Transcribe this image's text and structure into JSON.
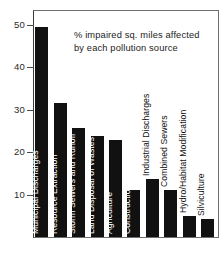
{
  "chart_data": {
    "type": "bar",
    "title": "% impaired sq. miles affected by each pollution source",
    "title_line1": "% impaired sq. miles affected",
    "title_line2": "by each pollution source",
    "xlabel": "",
    "ylabel": "",
    "ylim": [
      0,
      56
    ],
    "grid": false,
    "legend": false,
    "orientation": "vertical",
    "bar_color": "#111111",
    "yticks": [
      10,
      20,
      30,
      40,
      50
    ],
    "ytick_labels": [
      "10",
      "20",
      "30",
      "40",
      "50"
    ],
    "categories": [
      "Municipal Discharges",
      "Resource Extraction",
      "Storm Sewers and Runoff",
      "Land Disposal of Wastes",
      "Agriculture",
      "Construction",
      "Industrial Discharges",
      "Combined Sewers",
      "Hydro/Habitat Modification",
      "Silviculture"
    ],
    "values": [
      54,
      34.5,
      28,
      26,
      25,
      12,
      15,
      12,
      5.5,
      4.5
    ],
    "bars": [
      {
        "label": "Municipal Discharges",
        "value": 54,
        "label_inside": true
      },
      {
        "label": "Resource Extraction",
        "value": 34.5,
        "label_inside": true
      },
      {
        "label": "Storm Sewers and Runoff",
        "value": 28,
        "label_inside": true
      },
      {
        "label": "Land Disposal of Wastes",
        "value": 26,
        "label_inside": true
      },
      {
        "label": "Agriculture",
        "value": 25,
        "label_inside": true
      },
      {
        "label": "Construction",
        "value": 12,
        "label_inside": true
      },
      {
        "label": "Industrial Discharges",
        "value": 15,
        "label_inside": false
      },
      {
        "label": "Combined Sewers",
        "value": 12,
        "label_inside": false
      },
      {
        "label": "Hydro/Habitat Modification",
        "value": 5.5,
        "label_inside": false
      },
      {
        "label": "Silviculture",
        "value": 4.5,
        "label_inside": false
      }
    ]
  }
}
